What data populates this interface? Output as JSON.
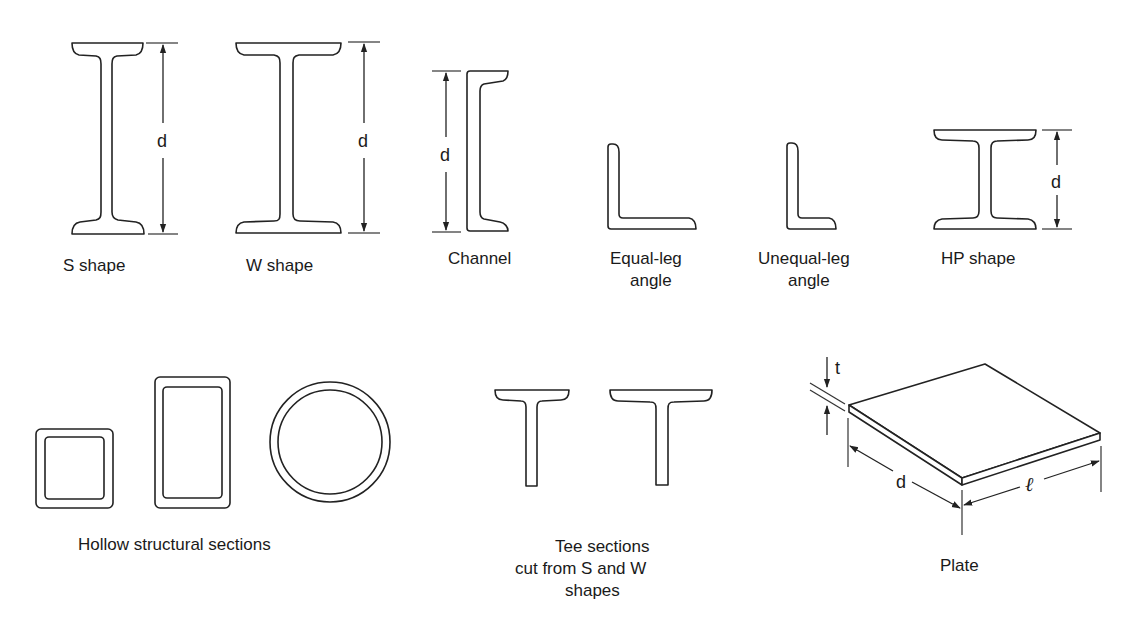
{
  "diagram": {
    "shapes": [
      {
        "id": "s-shape",
        "label": "S shape",
        "dimension": "d"
      },
      {
        "id": "w-shape",
        "label": "W shape",
        "dimension": "d"
      },
      {
        "id": "channel",
        "label": "Channel",
        "dimension": "d"
      },
      {
        "id": "equal-leg-angle",
        "label_lines": [
          "Equal-leg",
          "angle"
        ]
      },
      {
        "id": "unequal-leg-angle",
        "label_lines": [
          "Unequal-leg",
          "angle"
        ]
      },
      {
        "id": "hp-shape",
        "label": "HP shape",
        "dimension": "d"
      },
      {
        "id": "hollow-structural-sections",
        "label": "Hollow structural sections",
        "parts": [
          "square tube",
          "rectangular tube",
          "round pipe"
        ]
      },
      {
        "id": "tee-sections",
        "label_lines": [
          "Tee sections",
          "cut from S and W",
          "shapes"
        ]
      },
      {
        "id": "plate",
        "label": "Plate",
        "dimensions": {
          "thickness": "t",
          "depth": "d",
          "length": "ℓ"
        }
      }
    ],
    "colors": {
      "line": "#222222",
      "background": "#ffffff",
      "text": "#1a1a1a"
    }
  }
}
